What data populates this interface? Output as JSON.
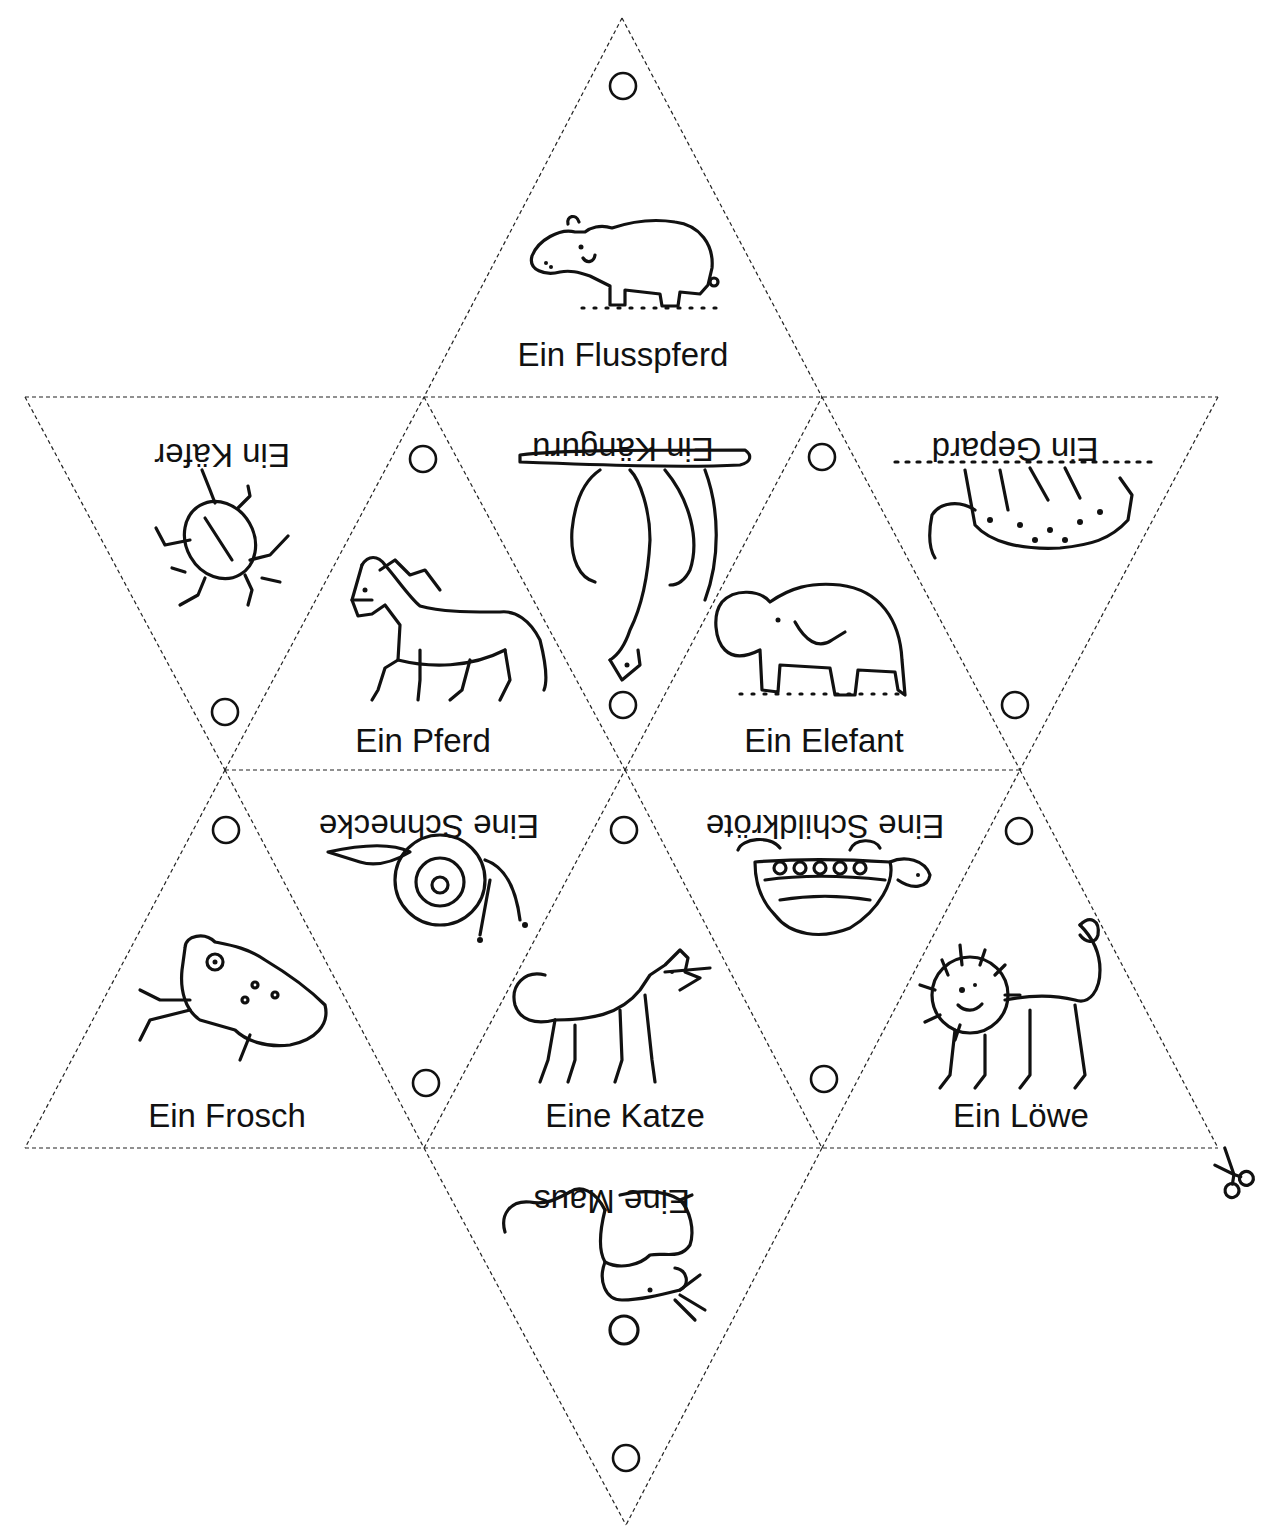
{
  "worksheet": {
    "type": "star-shaped tetrahedron cut-out (hexagram net)",
    "line_style": "dashed cut lines",
    "scissors_icon": "scissors-icon",
    "triangles": [
      {
        "id": "top",
        "label": "Ein Flusspferd",
        "animal": "hippo",
        "orientation": "upright"
      },
      {
        "id": "row1-left",
        "label": "Ein Käfer",
        "animal": "beetle",
        "orientation": "inverted"
      },
      {
        "id": "row1-mid-left",
        "label": "Ein Pferd",
        "animal": "horse",
        "orientation": "upright"
      },
      {
        "id": "row1-center",
        "label": "Ein Känguru",
        "animal": "kangaroo",
        "orientation": "inverted"
      },
      {
        "id": "row1-mid-right",
        "label": "Ein Elefant",
        "animal": "elephant",
        "orientation": "upright"
      },
      {
        "id": "row1-right",
        "label": "Ein Gepard",
        "animal": "cheetah",
        "orientation": "inverted"
      },
      {
        "id": "row2-left",
        "label": "Ein Frosch",
        "animal": "frog",
        "orientation": "upright"
      },
      {
        "id": "row2-mid-left",
        "label": "Eine Schnecke",
        "animal": "snail",
        "orientation": "inverted"
      },
      {
        "id": "row2-center",
        "label": "Eine Katze",
        "animal": "cat",
        "orientation": "upright"
      },
      {
        "id": "row2-mid-right",
        "label": "Eine Schildkröte",
        "animal": "turtle",
        "orientation": "inverted"
      },
      {
        "id": "row2-right",
        "label": "Ein Löwe",
        "animal": "lion",
        "orientation": "upright"
      },
      {
        "id": "bottom",
        "label": "Eine Maus",
        "animal": "mouse",
        "orientation": "inverted"
      }
    ]
  }
}
